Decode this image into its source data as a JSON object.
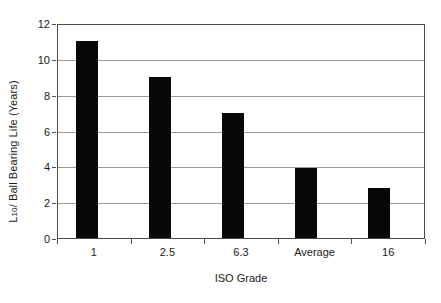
{
  "chart_data": {
    "type": "bar",
    "title": "",
    "categories": [
      "1",
      "2.5",
      "6.3",
      "Average",
      "16"
    ],
    "values": [
      11.0,
      9.0,
      7.0,
      3.9,
      2.8
    ],
    "series": [
      {
        "name": "Ball Bearing Life",
        "values": [
          11.0,
          9.0,
          7.0,
          3.9,
          2.8
        ]
      }
    ],
    "xlabel": "ISO Grade",
    "ylabel": "L10/ Ball Bearing Life (Years)",
    "ylabel_prefix": "L",
    "ylabel_subscript": "10",
    "ylabel_suffix": "/ Ball Bearing Life (Years)",
    "ylim": [
      0,
      12
    ],
    "ytick_values": [
      0,
      2,
      4,
      6,
      8,
      10,
      12
    ],
    "ytick_labels": [
      "0",
      "2",
      "4",
      "6",
      "8",
      "10",
      "12"
    ],
    "grid": true,
    "grid_axis": "y",
    "legend": false,
    "legend_position": "none",
    "bar_color": "#080808",
    "gridline_color": "#9a9a9a",
    "axis_color": "#4a4a4a",
    "background_color": "#ffffff"
  }
}
